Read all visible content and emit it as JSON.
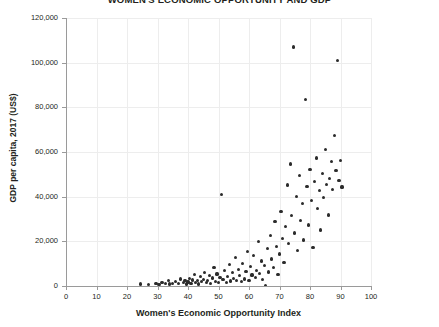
{
  "chart_data": {
    "type": "scatter",
    "title": "WOMEN'S ECONOMIC OPPORTUNITY AND GDP",
    "xlabel": "Women's Economic Opportunity Index",
    "ylabel": "GDP per capita, 2017 (US$)",
    "xlim": [
      0,
      100
    ],
    "ylim": [
      0,
      120000
    ],
    "xticks": [
      0,
      10,
      20,
      30,
      40,
      50,
      60,
      70,
      80,
      90,
      100
    ],
    "yticks": [
      0,
      20000,
      40000,
      60000,
      80000,
      100000,
      120000
    ],
    "xtick_labels": [
      "0",
      "10",
      "20",
      "30",
      "40",
      "50",
      "60",
      "70",
      "80",
      "90",
      "100"
    ],
    "ytick_labels": [
      "0",
      "20,000",
      "40,000",
      "60,000",
      "80,000",
      "100,000",
      "120,000"
    ],
    "grid": true,
    "legend": null,
    "marker_color": "#2b2b2b",
    "points": [
      [
        24.5,
        900
      ],
      [
        27.0,
        700
      ],
      [
        29.5,
        1100
      ],
      [
        30.5,
        800
      ],
      [
        31.5,
        1500
      ],
      [
        32.5,
        1200
      ],
      [
        33.5,
        2600
      ],
      [
        34.0,
        900
      ],
      [
        35.0,
        1300
      ],
      [
        36.0,
        2100
      ],
      [
        37.0,
        1000
      ],
      [
        37.5,
        3100
      ],
      [
        38.5,
        1400
      ],
      [
        39.0,
        2400
      ],
      [
        39.5,
        900
      ],
      [
        40.0,
        1800
      ],
      [
        40.5,
        3300
      ],
      [
        41.0,
        1200
      ],
      [
        41.5,
        2700
      ],
      [
        42.0,
        5200
      ],
      [
        42.5,
        1600
      ],
      [
        43.0,
        2300
      ],
      [
        43.5,
        900
      ],
      [
        44.0,
        4100
      ],
      [
        44.5,
        1900
      ],
      [
        45.0,
        3000
      ],
      [
        45.5,
        6200
      ],
      [
        46.0,
        1400
      ],
      [
        46.5,
        2500
      ],
      [
        47.0,
        4700
      ],
      [
        47.5,
        1100
      ],
      [
        48.0,
        3600
      ],
      [
        48.5,
        8200
      ],
      [
        49.0,
        2000
      ],
      [
        49.5,
        5400
      ],
      [
        50.0,
        1700
      ],
      [
        50.5,
        3900
      ],
      [
        51.0,
        41000
      ],
      [
        51.5,
        2800
      ],
      [
        52.0,
        6800
      ],
      [
        52.5,
        1500
      ],
      [
        53.0,
        4300
      ],
      [
        53.5,
        9600
      ],
      [
        54.0,
        2200
      ],
      [
        54.5,
        5900
      ],
      [
        55.0,
        3400
      ],
      [
        55.5,
        12800
      ],
      [
        56.0,
        2600
      ],
      [
        56.5,
        7400
      ],
      [
        57.0,
        4600
      ],
      [
        57.5,
        1900
      ],
      [
        58.0,
        10200
      ],
      [
        58.5,
        3100
      ],
      [
        59.0,
        6500
      ],
      [
        59.5,
        15400
      ],
      [
        60.0,
        2400
      ],
      [
        60.5,
        8800
      ],
      [
        61.0,
        4900
      ],
      [
        61.5,
        13500
      ],
      [
        62.0,
        3700
      ],
      [
        62.5,
        7100
      ],
      [
        63.0,
        19800
      ],
      [
        63.5,
        5500
      ],
      [
        64.0,
        11200
      ],
      [
        64.5,
        2900
      ],
      [
        65.0,
        9300
      ],
      [
        65.5,
        400
      ],
      [
        66.0,
        16700
      ],
      [
        66.5,
        6300
      ],
      [
        67.0,
        22500
      ],
      [
        67.5,
        12100
      ],
      [
        68.0,
        8400
      ],
      [
        68.5,
        28900
      ],
      [
        69.0,
        17600
      ],
      [
        69.5,
        5100
      ],
      [
        70.0,
        14300
      ],
      [
        70.5,
        33200
      ],
      [
        71.0,
        21400
      ],
      [
        71.5,
        10700
      ],
      [
        72.0,
        26800
      ],
      [
        72.5,
        45200
      ],
      [
        73.0,
        18900
      ],
      [
        73.5,
        54600
      ],
      [
        74.0,
        31500
      ],
      [
        74.5,
        107000
      ],
      [
        75.0,
        23700
      ],
      [
        75.5,
        40100
      ],
      [
        76.0,
        15900
      ],
      [
        76.5,
        49300
      ],
      [
        77.0,
        29400
      ],
      [
        77.5,
        36800
      ],
      [
        78.0,
        20600
      ],
      [
        78.5,
        83500
      ],
      [
        79.0,
        44700
      ],
      [
        79.5,
        27300
      ],
      [
        80.0,
        52100
      ],
      [
        80.5,
        38400
      ],
      [
        81.0,
        17200
      ],
      [
        81.5,
        46900
      ],
      [
        82.0,
        57300
      ],
      [
        82.5,
        34600
      ],
      [
        83.0,
        42800
      ],
      [
        83.5,
        25100
      ],
      [
        84.0,
        50400
      ],
      [
        84.5,
        39700
      ],
      [
        85.0,
        61200
      ],
      [
        85.5,
        45500
      ],
      [
        86.0,
        31800
      ],
      [
        86.5,
        48200
      ],
      [
        87.0,
        55800
      ],
      [
        87.5,
        43100
      ],
      [
        88.0,
        67500
      ],
      [
        88.5,
        51700
      ],
      [
        89.0,
        101000
      ],
      [
        89.5,
        47400
      ],
      [
        90.0,
        56200
      ],
      [
        90.5,
        44300
      ]
    ]
  }
}
